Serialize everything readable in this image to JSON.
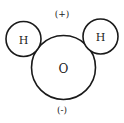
{
  "diagram": {
    "atoms": [
      {
        "id": "oxygen",
        "label": "O"
      },
      {
        "id": "hydrogen-left",
        "label": "H"
      },
      {
        "id": "hydrogen-right",
        "label": "H"
      }
    ],
    "charges": {
      "positive": "(+)",
      "negative": "(-)"
    }
  }
}
